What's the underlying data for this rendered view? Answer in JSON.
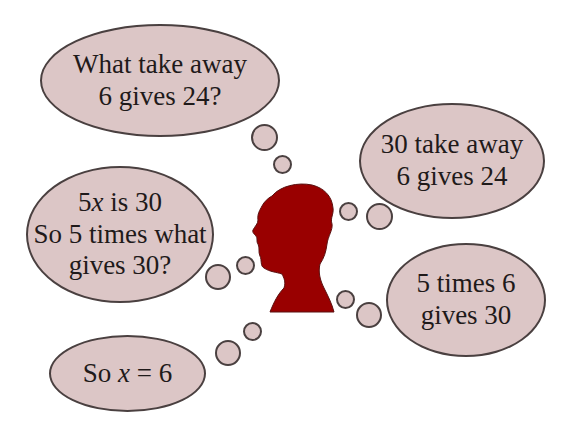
{
  "diagram": {
    "title": "",
    "colors": {
      "bubble_fill": "#dcc6c6",
      "bubble_border": "#4a4040",
      "head_fill": "#990000",
      "text": "#1f1a1a",
      "background": "#ffffff"
    },
    "head": {
      "icon": "head-silhouette-icon"
    },
    "bubbles": [
      {
        "id": "question-take-away",
        "lines": [
          "What take away",
          "6 gives 24?"
        ]
      },
      {
        "id": "answer-take-away",
        "lines": [
          "30 take away",
          "6 gives 24"
        ]
      },
      {
        "id": "five-x-is-30",
        "lines": [
          "5",
          "x",
          " is 30",
          "So 5 times what",
          "gives 30?"
        ]
      },
      {
        "id": "five-times-six",
        "lines": [
          "5 times 6",
          "gives 30"
        ]
      },
      {
        "id": "so-x-equals-6",
        "lines": [
          "So ",
          "x",
          " = 6"
        ]
      }
    ]
  }
}
